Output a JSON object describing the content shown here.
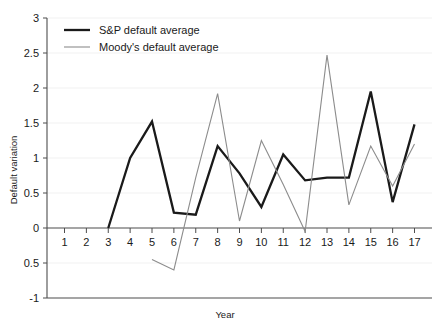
{
  "chart_data": {
    "type": "line",
    "title": "",
    "xlabel": "Year",
    "ylabel": "Default variation",
    "xlim": [
      0.2,
      17.8
    ],
    "ylim": [
      -1,
      3
    ],
    "xticks": [
      "1",
      "2",
      "3",
      "4",
      "5",
      "6",
      "7",
      "8",
      "9",
      "10",
      "11",
      "12",
      "13",
      "14",
      "15",
      "16",
      "17"
    ],
    "yticks": [
      "3",
      "2.5",
      "2",
      "1.5",
      "1",
      "0.5",
      "0",
      "0.5",
      "-1"
    ],
    "ytick_values": [
      3,
      2.5,
      2,
      1.5,
      1,
      0.5,
      0,
      -0.5,
      -1
    ],
    "grid": true,
    "legend_position": "top-left",
    "x": [
      1,
      2,
      3,
      4,
      5,
      6,
      7,
      8,
      9,
      10,
      11,
      12,
      13,
      14,
      15,
      16,
      17
    ],
    "series": [
      {
        "name": "S&P default average",
        "color": "#1a1a1a",
        "width": 2.3,
        "x": [
          3,
          4,
          5,
          6,
          7,
          8,
          9,
          10,
          11,
          12,
          13,
          14,
          15,
          16,
          17
        ],
        "values": [
          0.0,
          1.0,
          1.52,
          0.22,
          0.19,
          1.17,
          0.78,
          0.3,
          1.05,
          0.68,
          0.72,
          0.72,
          1.95,
          0.37,
          1.48
        ]
      },
      {
        "name": "Moody's default average",
        "color": "#8c8c8c",
        "width": 1.1,
        "x": [
          5,
          6,
          7,
          8,
          9,
          10,
          11,
          12,
          13,
          14,
          15,
          16,
          17
        ],
        "values": [
          -0.45,
          -0.6,
          0.72,
          1.92,
          0.1,
          1.25,
          0.62,
          -0.05,
          2.47,
          0.33,
          1.17,
          0.6,
          1.2
        ]
      }
    ]
  },
  "legend": {
    "items": [
      {
        "label": "S&P default average"
      },
      {
        "label": "Moody's default average"
      }
    ]
  },
  "axes": {
    "x_title": "Year",
    "y_title": "Default variation"
  }
}
